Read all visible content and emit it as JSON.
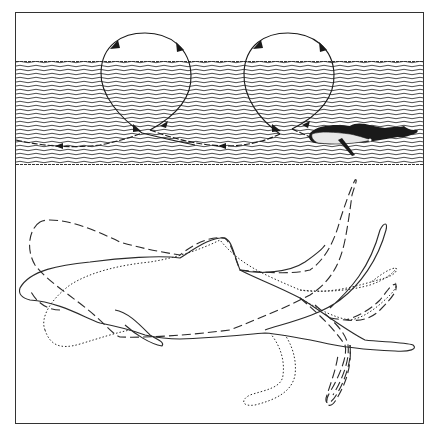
{
  "figure": {
    "colors": {
      "ink": "#1a1a1a",
      "water_line": "#3a3a3a",
      "background": "#ffffff",
      "whale_belly": "#e8e8e8"
    },
    "top_panel": {
      "name": "trajectory-panel",
      "loops": 2,
      "arrow_count": 8
    },
    "bottom_panel": {
      "name": "outlines-panel",
      "outline_styles": [
        "solid",
        "dashed",
        "dotted"
      ]
    }
  }
}
